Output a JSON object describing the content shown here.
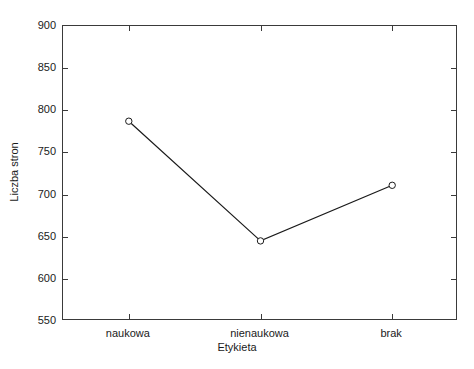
{
  "chart_data": {
    "type": "line",
    "title": "",
    "xlabel": "Etykieta",
    "ylabel": "Liczba stron",
    "categories": [
      "naukowa",
      "nienaukowa",
      "brak"
    ],
    "values": [
      787,
      645,
      711
    ],
    "series": [
      {
        "name": "Liczba stron",
        "values": [
          787,
          645,
          711
        ]
      }
    ],
    "ylim": [
      550,
      900
    ],
    "yticks": [
      550,
      600,
      650,
      700,
      750,
      800,
      850,
      900
    ],
    "ytick_labels": [
      "550",
      "600",
      "650",
      "700",
      "750",
      "800",
      "850",
      "900"
    ],
    "xtick_labels": [
      "naukowa",
      "nienaukowa",
      "brak"
    ],
    "grid": false,
    "legend": false,
    "legend_position": "none",
    "marker": "open-circle",
    "line_color": "#1a1a1a",
    "marker_fill": "#ffffff",
    "background_color": "#ffffff",
    "frame_color": "#3a3a3a",
    "ticks_direction": "inward",
    "frame_all_sides": true
  },
  "axes": {
    "y_title": "Liczba stron",
    "x_title": "Etykieta"
  }
}
